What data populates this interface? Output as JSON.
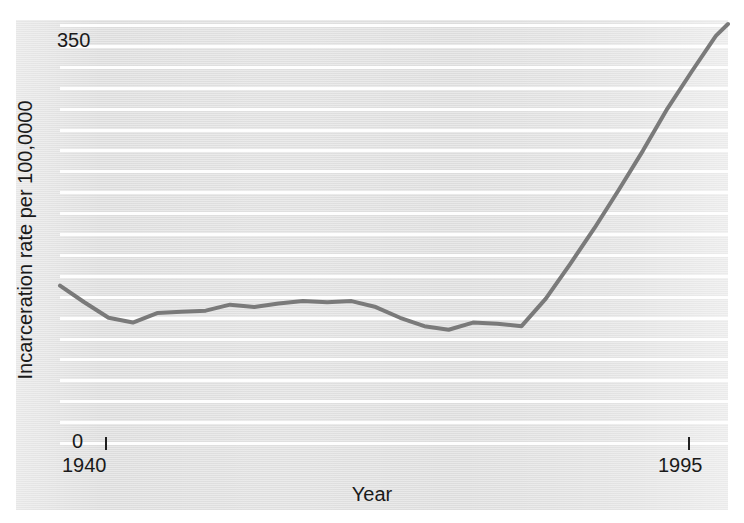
{
  "chart_data": {
    "type": "line",
    "title": "",
    "xlabel": "Year",
    "ylabel": "Incarceration rate per 100,0000",
    "xlim": [
      1940,
      1995
    ],
    "ylim": [
      0,
      350
    ],
    "ytick_labels": [
      "0",
      "350"
    ],
    "xtick_labels": [
      "1940",
      "1995"
    ],
    "grid": "horizontal",
    "legend": "none",
    "line_color": "#7a7a7a",
    "panel_color": "#e9e9e9",
    "gridline_color": "#ffffff",
    "series": [
      {
        "name": "Incarceration rate",
        "x": [
          1940,
          1942,
          1944,
          1946,
          1948,
          1950,
          1952,
          1954,
          1956,
          1958,
          1960,
          1962,
          1964,
          1966,
          1968,
          1970,
          1972,
          1974,
          1976,
          1978,
          1980,
          1982,
          1984,
          1986,
          1988,
          1990,
          1992,
          1994,
          1995
        ],
        "values": [
          131,
          117,
          104,
          100,
          108,
          109,
          110,
          115,
          113,
          116,
          118,
          117,
          118,
          113,
          104,
          97,
          94,
          100,
          99,
          97,
          120,
          149,
          179,
          211,
          244,
          279,
          310,
          340,
          350
        ]
      }
    ]
  },
  "axis": {
    "y_max_label": "350",
    "y_min_label": "0",
    "x_min_label": "1940",
    "x_max_label": "1995",
    "y_title": "Incarceration rate per 100,0000",
    "x_title": "Year"
  }
}
